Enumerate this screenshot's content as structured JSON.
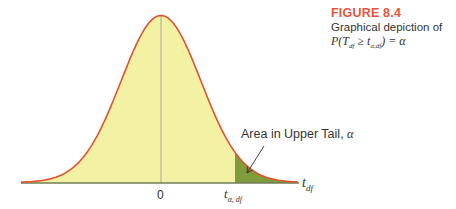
{
  "caption": {
    "figure_label": "FIGURE 8.4",
    "description": "Graphical depiction of",
    "formula": {
      "prefix": "P(T",
      "sub1": "df",
      "middle": " ≥ t",
      "sub2": "α,df",
      "suffix": ") = α"
    }
  },
  "labels": {
    "area": "Area in Upper Tail, ",
    "alpha": "α",
    "zero": "0",
    "t_alpha": "t",
    "t_alpha_sub": "α, df",
    "t_df": "t",
    "t_df_sub": "df"
  },
  "colors": {
    "curve": "#e3522e",
    "fill": "#f3f1a4",
    "tail_fill": "#7f9c3a",
    "axis": "#6f7d58",
    "center_line": "#a9a9a0",
    "caption_accent": "#e8543a"
  },
  "chart_data": {
    "type": "area",
    "distribution": "Student t density curve",
    "xlabel": "t_df",
    "ylabel": "",
    "x_ticks": [
      "0",
      "t_α,df"
    ],
    "x_range_std": [
      -3.5,
      3.5
    ],
    "critical_value_std": 1.85,
    "shaded_region": "upper tail (t ≥ t_α,df)",
    "annotation": "Area in Upper Tail, α",
    "grid": false,
    "legend": null
  }
}
